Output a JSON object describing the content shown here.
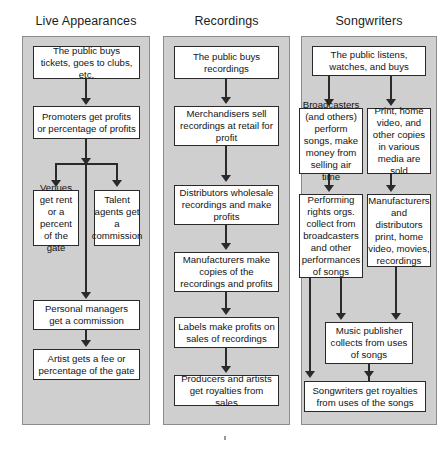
{
  "diagram": {
    "type": "flowchart",
    "colors": {
      "panel_background": "#cfcfcf",
      "panel_border": "#8c8c8c",
      "node_background": "#ffffff",
      "node_border": "#2a2a2a",
      "connector": "#2a2a2a",
      "text": "#141414",
      "page_background": "#ffffff"
    },
    "columns": [
      {
        "id": "live-appearances",
        "title": "Live Appearances",
        "nodes": [
          {
            "id": "la-1",
            "text": "The public buys tickets, goes to clubs, etc."
          },
          {
            "id": "la-2",
            "text": "Promoters get profits or percentage of profits"
          },
          {
            "id": "la-3",
            "text": "Venues get rent or a percent of the gate"
          },
          {
            "id": "la-4",
            "text": "Talent agents get a commission"
          },
          {
            "id": "la-5",
            "text": "Personal managers get a commission"
          },
          {
            "id": "la-6",
            "text": "Artist gets a fee or percentage of the gate"
          }
        ],
        "edges": [
          {
            "from": "la-1",
            "to": "la-2"
          },
          {
            "from": "la-2",
            "to": "la-3"
          },
          {
            "from": "la-2",
            "to": "la-4"
          },
          {
            "from": "la-2",
            "to": "la-5"
          },
          {
            "from": "la-5",
            "to": "la-6"
          }
        ]
      },
      {
        "id": "recordings",
        "title": "Recordings",
        "nodes": [
          {
            "id": "rc-1",
            "text": "The public buys recordings"
          },
          {
            "id": "rc-2",
            "text": "Merchandisers sell recordings at retail for profit"
          },
          {
            "id": "rc-3",
            "text": "Distributors wholesale recordings and make profits"
          },
          {
            "id": "rc-4",
            "text": "Manufacturers make copies of the recordings and profits"
          },
          {
            "id": "rc-5",
            "text": "Labels make profits on sales of recordings"
          },
          {
            "id": "rc-6",
            "text": "Producers and artists get royalties from sales"
          }
        ],
        "edges": [
          {
            "from": "rc-1",
            "to": "rc-2"
          },
          {
            "from": "rc-2",
            "to": "rc-3"
          },
          {
            "from": "rc-3",
            "to": "rc-4"
          },
          {
            "from": "rc-4",
            "to": "rc-5"
          },
          {
            "from": "rc-5",
            "to": "rc-6"
          }
        ]
      },
      {
        "id": "songwriters",
        "title": "Songwriters",
        "nodes": [
          {
            "id": "sw-1",
            "text": "The public listens, watches, and buys"
          },
          {
            "id": "sw-2",
            "text": "Broadcasters (and others) perform songs, make money from selling air time"
          },
          {
            "id": "sw-3",
            "text": "Print, home video, and other copies in various media are sold"
          },
          {
            "id": "sw-4",
            "text": "Performing rights orgs. collect from broadcasters and other performances of songs"
          },
          {
            "id": "sw-5",
            "text": "Manufacturers and distributors print, home video, movies, recordings"
          },
          {
            "id": "sw-6",
            "text": "Music publisher collects from uses of songs"
          },
          {
            "id": "sw-7",
            "text": "Songwriters get royalties from uses of the songs"
          }
        ],
        "edges": [
          {
            "from": "sw-1",
            "to": "sw-2"
          },
          {
            "from": "sw-1",
            "to": "sw-3"
          },
          {
            "from": "sw-2",
            "to": "sw-4"
          },
          {
            "from": "sw-3",
            "to": "sw-5"
          },
          {
            "from": "sw-4",
            "to": "sw-6"
          },
          {
            "from": "sw-5",
            "to": "sw-6"
          },
          {
            "from": "sw-4",
            "to": "sw-7"
          },
          {
            "from": "sw-6",
            "to": "sw-7"
          }
        ]
      }
    ]
  }
}
